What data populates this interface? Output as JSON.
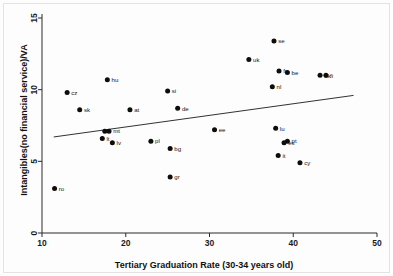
{
  "chart_data": {
    "type": "scatter",
    "title": "",
    "xlabel": "Tertiary Graduation Rate (30-34 years old)",
    "ylabel": "Intangibles(no financial service)/VA",
    "xlim": [
      10,
      50
    ],
    "ylim": [
      0,
      15
    ],
    "xticks": [
      10,
      20,
      30,
      40,
      50
    ],
    "yticks": [
      0,
      5,
      10,
      15
    ],
    "grid": false,
    "legend": "none",
    "point_color": "#0d0d0d",
    "line_color": "#1b1b1b",
    "points": [
      {
        "label": "ro",
        "x": 11.5,
        "y": 3.1
      },
      {
        "label": "cz",
        "x": 13.0,
        "y": 9.8
      },
      {
        "label": "sk",
        "x": 14.5,
        "y": 8.6
      },
      {
        "label": "lt",
        "x": 17.2,
        "y": 6.6
      },
      {
        "label": "mt",
        "x": 18.0,
        "y": 7.1
      },
      {
        "label": "hu",
        "x": 17.8,
        "y": 10.7
      },
      {
        "label": "ee2",
        "x": 17.5,
        "y": 7.1
      },
      {
        "label": "lv",
        "x": 18.4,
        "y": 6.3
      },
      {
        "label": "at",
        "x": 20.5,
        "y": 8.6
      },
      {
        "label": "pl",
        "x": 23.0,
        "y": 6.4
      },
      {
        "label": "si",
        "x": 25.0,
        "y": 9.9
      },
      {
        "label": "bg",
        "x": 25.3,
        "y": 5.9
      },
      {
        "label": "gr",
        "x": 25.3,
        "y": 3.9
      },
      {
        "label": "de",
        "x": 26.2,
        "y": 8.7
      },
      {
        "label": "ee",
        "x": 30.6,
        "y": 7.2
      },
      {
        "label": "uk",
        "x": 34.7,
        "y": 12.1
      },
      {
        "label": "nl",
        "x": 37.5,
        "y": 10.2
      },
      {
        "label": "se",
        "x": 37.7,
        "y": 13.4
      },
      {
        "label": "lu",
        "x": 37.9,
        "y": 7.3
      },
      {
        "label": "it",
        "x": 38.2,
        "y": 5.4
      },
      {
        "label": "fr",
        "x": 38.3,
        "y": 11.3
      },
      {
        "label": "es",
        "x": 38.9,
        "y": 6.3
      },
      {
        "label": "pt",
        "x": 39.3,
        "y": 6.4
      },
      {
        "label": "be",
        "x": 39.3,
        "y": 11.2
      },
      {
        "label": "cy",
        "x": 40.8,
        "y": 4.9
      },
      {
        "label": "dk",
        "x": 43.2,
        "y": 11.0
      },
      {
        "label": "fi",
        "x": 43.9,
        "y": 11.0
      }
    ],
    "trendline": {
      "x0": 11.4,
      "y0": 6.7,
      "x1": 47.2,
      "y1": 9.6
    }
  }
}
